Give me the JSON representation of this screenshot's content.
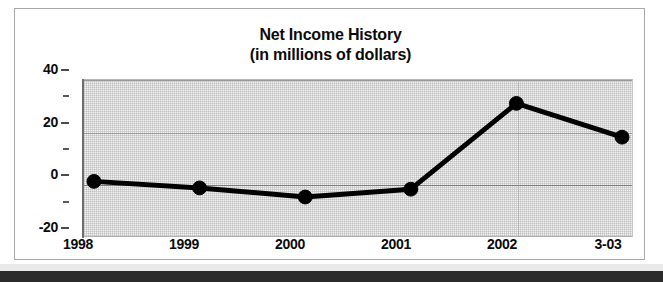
{
  "chart_data": {
    "type": "line",
    "title": "Net Income History",
    "subtitle": "(in millions of dollars)",
    "xlabel": "",
    "ylabel": "",
    "categories": [
      "1998",
      "1999",
      "2000",
      "2001",
      "2002",
      "3-03"
    ],
    "values": [
      1,
      -1.5,
      -5,
      -2,
      31,
      18
    ],
    "series": [
      {
        "name": "Net Income",
        "values": [
          1,
          -1.5,
          -5,
          -2,
          31,
          18
        ]
      }
    ],
    "ylim": [
      -20,
      40
    ],
    "y_ticks": [
      "40",
      "20",
      "0",
      "-20"
    ],
    "y_tick_values": [
      40,
      20,
      0,
      -20
    ],
    "y_minor_tick_values": [
      30,
      10,
      -10
    ],
    "x_tick_labels": [
      "1998",
      "1999",
      "2000",
      "2001",
      "2002",
      "3-03"
    ],
    "grid": true,
    "legend": false,
    "legend_position": "none",
    "line_color": "#000000",
    "marker_color": "#000000",
    "plot_background": "#f2f2f2",
    "frame_color": "#a8a8a8"
  },
  "axis": {
    "y_labels": [
      {
        "text": "40",
        "value": 40
      },
      {
        "text": "20",
        "value": 20
      },
      {
        "text": "0",
        "value": 0
      },
      {
        "text": "-20",
        "value": -20
      }
    ],
    "x_labels": [
      {
        "text": "1998"
      },
      {
        "text": "1999"
      },
      {
        "text": "2000"
      },
      {
        "text": "2001"
      },
      {
        "text": "2002"
      },
      {
        "text": "3-03"
      }
    ]
  }
}
